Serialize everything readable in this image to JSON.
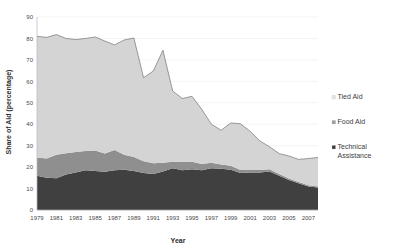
{
  "chart_data": {
    "type": "area",
    "stacked": true,
    "title": "",
    "xlabel": "Year",
    "ylabel": "Share of Aid (percentage)",
    "xlim": [
      1979,
      2008
    ],
    "ylim": [
      0,
      90
    ],
    "ytick_step": 10,
    "yticks": [
      0,
      10,
      20,
      30,
      40,
      50,
      60,
      70,
      80,
      90
    ],
    "grid": true,
    "grid_axis": "y",
    "legend_position": "right",
    "x": [
      1979,
      1980,
      1981,
      1982,
      1983,
      1984,
      1985,
      1986,
      1987,
      1988,
      1989,
      1990,
      1991,
      1992,
      1993,
      1994,
      1995,
      1996,
      1997,
      1998,
      1999,
      2000,
      2001,
      2002,
      2003,
      2004,
      2005,
      2006,
      2007,
      2008
    ],
    "xtick_labels": [
      "1979",
      "1981",
      "1983",
      "1985",
      "1987",
      "1989",
      "1991",
      "1993",
      "1995",
      "1997",
      "1999",
      "2001",
      "2003",
      "2005",
      "2007"
    ],
    "series": [
      {
        "name": "Technical Assistance",
        "color": "#404040",
        "values": [
          16.0,
          15.0,
          14.8,
          16.5,
          17.5,
          18.5,
          18.2,
          17.8,
          18.5,
          18.8,
          18.2,
          17.2,
          16.8,
          18.0,
          19.5,
          18.5,
          19.0,
          18.5,
          19.5,
          19.2,
          18.8,
          17.2,
          17.5,
          17.5,
          18.0,
          16.0,
          14.0,
          12.5,
          11.0,
          10.5
        ]
      },
      {
        "name": "Food Aid",
        "color": "#8f8f8f",
        "values": [
          8.5,
          9.0,
          11.0,
          10.0,
          9.5,
          9.0,
          9.5,
          8.5,
          9.5,
          7.0,
          6.5,
          5.5,
          5.0,
          4.0,
          3.0,
          4.0,
          3.5,
          3.0,
          2.5,
          2.0,
          1.8,
          1.5,
          1.2,
          1.2,
          1.0,
          0.8,
          0.7,
          0.6,
          0.5,
          0.5
        ]
      },
      {
        "name": "Tied Aid",
        "color": "#d4d4d4",
        "values": [
          56.5,
          56.5,
          56.0,
          53.5,
          52.5,
          52.5,
          53.0,
          52.5,
          49.0,
          53.5,
          55.5,
          39.0,
          43.0,
          52.5,
          33.0,
          29.5,
          30.5,
          25.5,
          18.0,
          16.0,
          20.0,
          21.5,
          18.0,
          13.5,
          10.5,
          9.5,
          10.5,
          10.5,
          12.5,
          13.5
        ]
      }
    ],
    "legend_entries": [
      {
        "label": "Tied Aid",
        "color": "#e4e4e4"
      },
      {
        "label": "Food Aid",
        "color": "#9a9a9a"
      },
      {
        "label": "Technical Assistance",
        "color": "#3c3c3c"
      }
    ]
  },
  "legend": {
    "items": [
      {
        "label": "Tied Aid",
        "label_line1": "Tied Aid",
        "label_line2": ""
      },
      {
        "label": "Food Aid",
        "label_line1": "Food Aid",
        "label_line2": ""
      },
      {
        "label": "Technical Assistance",
        "label_line1": "Technical",
        "label_line2": "Assistance"
      }
    ]
  },
  "axes": {
    "x_title": "Year",
    "y_title": "Share of Aid (percentage)",
    "y_labels": [
      "90",
      "80",
      "70",
      "60",
      "50",
      "40",
      "30",
      "20",
      "10",
      "0"
    ],
    "x_labels": [
      "1979",
      "1981",
      "1983",
      "1985",
      "1987",
      "1989",
      "1991",
      "1993",
      "1995",
      "1997",
      "1999",
      "2001",
      "2003",
      "2005",
      "2007"
    ]
  },
  "colors": {
    "tied_aid": "#d4d4d4",
    "food_aid": "#8f8f8f",
    "technical_assistance": "#404040",
    "grid": "#ececec",
    "axis": "#b8b8b8",
    "text": "#3a3a3a",
    "background": "#ffffff"
  }
}
